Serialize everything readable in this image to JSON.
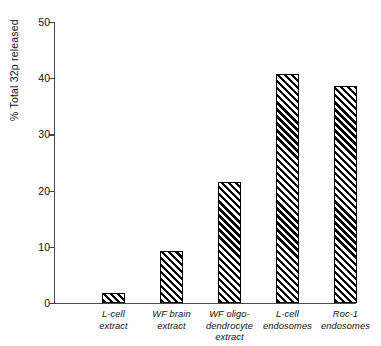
{
  "chart_data": {
    "type": "bar",
    "title": "",
    "subtitle": "",
    "xlabel": "",
    "ylabel": "% Total 32p released",
    "ylim": [
      0,
      50
    ],
    "yticks": [
      0,
      10,
      20,
      30,
      40,
      50
    ],
    "ytick_labels": [
      "0",
      "10",
      "20",
      "30",
      "40",
      "50"
    ],
    "grid": false,
    "legend": null,
    "categories": [
      "L-cell extract",
      "WF brain extract",
      "WF oligo-dendrocyte extract",
      "L-cell endosomes",
      "Roc-1 endosomes"
    ],
    "category_lines": [
      [
        "L-cell",
        "extract"
      ],
      [
        "WF brain",
        "extract"
      ],
      [
        "WF oligo-",
        "dendrocyte",
        "extract"
      ],
      [
        "L-cell",
        "endosomes"
      ],
      [
        "Roc-1",
        "endosomes"
      ]
    ],
    "values": [
      1.7,
      9.3,
      21.5,
      40.7,
      38.7
    ],
    "bar_style": {
      "fill": "diagonal-hatch",
      "hatch_color": "#000000",
      "background": "#ffffff",
      "edge_color": "#000000"
    },
    "axis_color": "#4a4a4a"
  }
}
